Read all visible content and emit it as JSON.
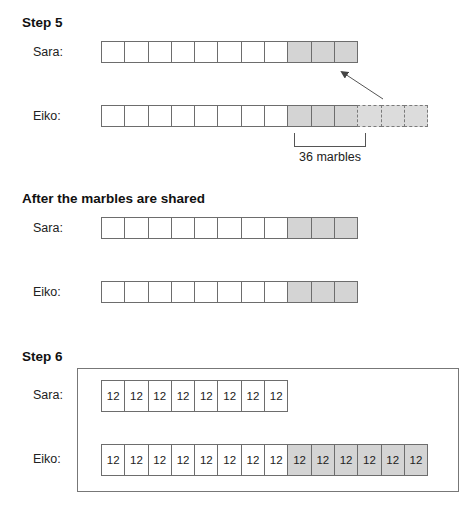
{
  "step5": {
    "heading": "Step 5",
    "sara": {
      "label": "Sara:",
      "cells": [
        "",
        "",
        "",
        "",
        "",
        "",
        "",
        "",
        "",
        "",
        ""
      ],
      "shaded_from": 8
    },
    "eiko": {
      "label": "Eiko:",
      "cells": [
        "",
        "",
        "",
        "",
        "",
        "",
        "",
        "",
        "",
        "",
        ""
      ],
      "shaded_from": 8,
      "dashed_extra": 3
    },
    "bracket_label": "36 marbles",
    "arrow": {
      "from": "eiko-dashed-cells",
      "to": "sara-shaded-cells"
    }
  },
  "after_shared": {
    "heading": "After the marbles are shared",
    "sara": {
      "label": "Sara:",
      "cells": [
        "",
        "",
        "",
        "",
        "",
        "",
        "",
        "",
        "",
        "",
        ""
      ],
      "shaded_from": 8
    },
    "eiko": {
      "label": "Eiko:",
      "cells": [
        "",
        "",
        "",
        "",
        "",
        "",
        "",
        "",
        "",
        "",
        ""
      ],
      "shaded_from": 8
    }
  },
  "step6": {
    "heading": "Step 6",
    "sara": {
      "label": "Sara:",
      "cells": [
        "12",
        "12",
        "12",
        "12",
        "12",
        "12",
        "12",
        "12"
      ],
      "shaded_from": 99
    },
    "eiko": {
      "label": "Eiko:",
      "cells": [
        "12",
        "12",
        "12",
        "12",
        "12",
        "12",
        "12",
        "12",
        "12",
        "12",
        "12",
        "12",
        "12",
        "12"
      ],
      "shaded_from": 8
    }
  },
  "colors": {
    "shaded": "#d4d4d4",
    "border": "#6d6d6d"
  }
}
